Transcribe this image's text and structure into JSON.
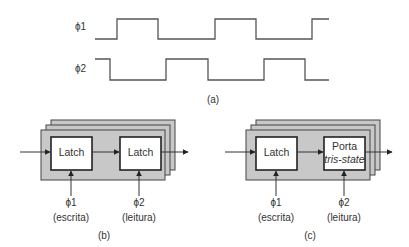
{
  "panel_a": {
    "caption": "(a)",
    "signals": [
      {
        "name": "ϕ1",
        "label": "ϕ1",
        "polyline": "95,39 117,39 117,19 158,19 158,39 215,39 215,19 256,19 256,39 312,39 312,19 329,19"
      },
      {
        "name": "ϕ2",
        "label": "ϕ2",
        "polyline": "95,59 110,59 110,80 166,80 166,59 208,59 208,80 264,80 264,59 305,59 305,80 329,80"
      }
    ]
  },
  "panel_b": {
    "caption": "(b)",
    "block1": {
      "label": "Latch"
    },
    "block2": {
      "label": "Latch"
    },
    "clock1": {
      "label": "ϕ1",
      "desc": "(escrita)"
    },
    "clock2": {
      "label": "ϕ2",
      "desc": "(leitura)"
    }
  },
  "panel_c": {
    "caption": "(c)",
    "block1": {
      "label": "Latch"
    },
    "block2": {
      "label_line1": "Porta",
      "label_line2": "tris-state"
    },
    "clock1": {
      "label": "ϕ1",
      "desc": "(escrita)"
    },
    "clock2": {
      "label": "ϕ2",
      "desc": "(leitura)"
    }
  },
  "colors": {
    "stack_fill": "#c8c8c8",
    "block_fill": "#ffffff",
    "line": "#333333"
  }
}
